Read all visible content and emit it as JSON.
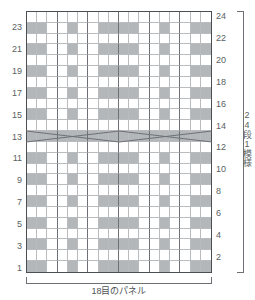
{
  "chart_data": {
    "type": "heatmap",
    "title": "",
    "subtitle": "",
    "xlabel": "18目のパネル",
    "ylabel": "24段1模様",
    "grid": true,
    "legend_position": "none",
    "columns": 18,
    "rows": 24,
    "stitch_colors": {
      "knit": "#b4b7ba",
      "purl": "#ffffff"
    },
    "left_tick_labels": [
      "23",
      "21",
      "19",
      "17",
      "15",
      "13",
      "11",
      "9",
      "7",
      "5",
      "3",
      "1"
    ],
    "right_tick_labels": [
      "24",
      "22",
      "20",
      "18",
      "16",
      "14",
      "12",
      "10",
      "8",
      "6",
      "4",
      "2"
    ],
    "annotations": [
      {
        "name": "cable-cross",
        "rows": [
          13,
          15
        ],
        "description": "6/6 cable crossing lines spanning the panel between rows 13 and 15"
      }
    ],
    "row_order": "bottom-to-top",
    "note": "1 = shaded (knit) cell, 0 = white (purl) cell; arrays are listed from row 24 at top down to row 1 at bottom",
    "matrix": [
      [
        0,
        0,
        0,
        0,
        0,
        0,
        0,
        0,
        0,
        0,
        0,
        0,
        0,
        0,
        0,
        0,
        0,
        0
      ],
      [
        1,
        1,
        0,
        0,
        1,
        0,
        0,
        1,
        1,
        1,
        1,
        0,
        0,
        1,
        0,
        0,
        1,
        1
      ],
      [
        0,
        0,
        0,
        0,
        0,
        0,
        0,
        0,
        0,
        0,
        0,
        0,
        0,
        0,
        0,
        0,
        0,
        0
      ],
      [
        1,
        1,
        0,
        0,
        1,
        0,
        0,
        1,
        1,
        1,
        1,
        0,
        0,
        1,
        0,
        0,
        1,
        1
      ],
      [
        0,
        0,
        0,
        0,
        0,
        0,
        0,
        0,
        0,
        0,
        0,
        0,
        0,
        0,
        0,
        0,
        0,
        0
      ],
      [
        1,
        1,
        0,
        0,
        1,
        0,
        0,
        1,
        1,
        1,
        1,
        0,
        0,
        1,
        0,
        0,
        1,
        1
      ],
      [
        0,
        0,
        0,
        0,
        0,
        0,
        0,
        0,
        0,
        0,
        0,
        0,
        0,
        0,
        0,
        0,
        0,
        0
      ],
      [
        1,
        1,
        0,
        0,
        1,
        0,
        0,
        1,
        1,
        1,
        1,
        0,
        0,
        1,
        0,
        0,
        1,
        1
      ],
      [
        0,
        0,
        0,
        0,
        0,
        0,
        0,
        0,
        0,
        0,
        0,
        0,
        0,
        0,
        0,
        0,
        0,
        0
      ],
      [
        1,
        1,
        0,
        0,
        1,
        0,
        0,
        1,
        1,
        1,
        1,
        0,
        0,
        1,
        0,
        0,
        1,
        1
      ],
      [
        0,
        0,
        0,
        0,
        0,
        0,
        0,
        0,
        0,
        0,
        0,
        0,
        0,
        0,
        0,
        0,
        0,
        0
      ],
      [
        1,
        1,
        1,
        1,
        1,
        1,
        1,
        1,
        1,
        1,
        1,
        1,
        1,
        1,
        1,
        1,
        1,
        1
      ],
      [
        0,
        0,
        0,
        0,
        0,
        0,
        0,
        0,
        0,
        0,
        0,
        0,
        0,
        0,
        0,
        0,
        0,
        0
      ],
      [
        1,
        1,
        0,
        0,
        1,
        0,
        0,
        1,
        1,
        1,
        1,
        0,
        0,
        1,
        0,
        0,
        1,
        1
      ],
      [
        0,
        0,
        0,
        0,
        0,
        0,
        0,
        0,
        0,
        0,
        0,
        0,
        0,
        0,
        0,
        0,
        0,
        0
      ],
      [
        1,
        1,
        0,
        0,
        1,
        0,
        0,
        1,
        1,
        1,
        1,
        0,
        0,
        1,
        0,
        0,
        1,
        1
      ],
      [
        0,
        0,
        0,
        0,
        0,
        0,
        0,
        0,
        0,
        0,
        0,
        0,
        0,
        0,
        0,
        0,
        0,
        0
      ],
      [
        1,
        1,
        0,
        0,
        1,
        0,
        0,
        1,
        1,
        1,
        1,
        0,
        0,
        1,
        0,
        0,
        1,
        1
      ],
      [
        0,
        0,
        0,
        0,
        0,
        0,
        0,
        0,
        0,
        0,
        0,
        0,
        0,
        0,
        0,
        0,
        0,
        0
      ],
      [
        1,
        1,
        0,
        0,
        1,
        0,
        0,
        1,
        1,
        1,
        1,
        0,
        0,
        1,
        0,
        0,
        1,
        1
      ],
      [
        0,
        0,
        0,
        0,
        0,
        0,
        0,
        0,
        0,
        0,
        0,
        0,
        0,
        0,
        0,
        0,
        0,
        0
      ],
      [
        1,
        1,
        0,
        0,
        1,
        0,
        0,
        1,
        1,
        1,
        1,
        0,
        0,
        1,
        0,
        0,
        1,
        1
      ],
      [
        0,
        0,
        0,
        0,
        0,
        0,
        0,
        0,
        0,
        0,
        0,
        0,
        0,
        0,
        0,
        0,
        0,
        0
      ],
      [
        1,
        1,
        0,
        0,
        1,
        0,
        0,
        1,
        1,
        1,
        1,
        0,
        0,
        1,
        0,
        0,
        1,
        1
      ]
    ]
  },
  "labels": {
    "bottom_caption": "18目のパネル",
    "right_caption": "24段1模様"
  }
}
